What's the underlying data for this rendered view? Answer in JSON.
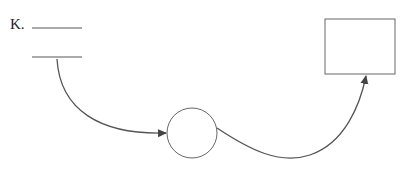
{
  "diagram": {
    "label": "K.",
    "nodes": [
      {
        "id": "blank-line-top",
        "type": "line"
      },
      {
        "id": "blank-line-bottom",
        "type": "line"
      },
      {
        "id": "circle",
        "type": "circle"
      },
      {
        "id": "box",
        "type": "rectangle"
      }
    ],
    "edges": [
      {
        "from": "blank-line-bottom",
        "to": "circle"
      },
      {
        "from": "circle",
        "to": "box"
      }
    ],
    "colors": {
      "stroke": "#555555",
      "arrow": "#444444"
    }
  }
}
